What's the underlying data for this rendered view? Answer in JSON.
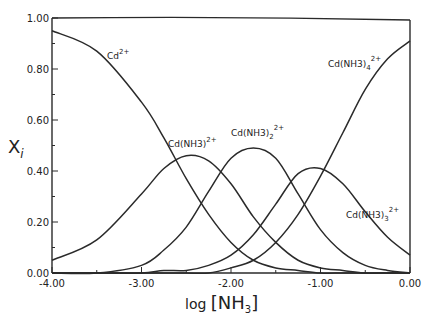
{
  "chart_data": {
    "type": "line",
    "title": "",
    "xlabel": "log [NH3]",
    "ylabel": "X_i",
    "xlim": [
      -4.0,
      0.0
    ],
    "ylim": [
      0.0,
      1.0
    ],
    "x_ticks": [
      "-4.00",
      "-3.00",
      "-2.00",
      "-1.00",
      "0.00"
    ],
    "y_ticks": [
      "0.00",
      "0.20",
      "0.40",
      "0.60",
      "0.80",
      "1.00"
    ],
    "grid": false,
    "legend": "inline labels",
    "x": [
      -4.0,
      -3.5,
      -3.0,
      -2.75,
      -2.5,
      -2.25,
      -2.0,
      -1.75,
      -1.5,
      -1.25,
      -1.0,
      -0.75,
      -0.5,
      -0.25,
      0.0
    ],
    "series": [
      {
        "name": "Cd2+",
        "label": "Cd",
        "charge": "2+",
        "values": [
          0.95,
          0.87,
          0.67,
          0.53,
          0.37,
          0.23,
          0.12,
          0.05,
          0.02,
          0.01,
          0.0,
          0.0,
          0.0,
          0.0,
          0.0
        ]
      },
      {
        "name": "Cd(NH3)2+",
        "label": "Cd(NH3)",
        "sub": "",
        "charge": "2+",
        "values": [
          0.05,
          0.13,
          0.31,
          0.41,
          0.46,
          0.44,
          0.35,
          0.22,
          0.12,
          0.05,
          0.02,
          0.01,
          0.0,
          0.0,
          0.0
        ]
      },
      {
        "name": "Cd(NH3)2 2+",
        "label": "Cd(NH3)",
        "sub": "2",
        "charge": "2+",
        "values": [
          0.0,
          0.0,
          0.03,
          0.09,
          0.18,
          0.32,
          0.45,
          0.49,
          0.45,
          0.31,
          0.17,
          0.08,
          0.03,
          0.01,
          0.0
        ]
      },
      {
        "name": "Cd(NH3)3 2+",
        "label": "Cd(NH3)",
        "sub": "3",
        "charge": "2+",
        "values": [
          0.0,
          0.0,
          0.0,
          0.01,
          0.01,
          0.03,
          0.07,
          0.15,
          0.27,
          0.39,
          0.41,
          0.35,
          0.24,
          0.14,
          0.07
        ]
      },
      {
        "name": "Cd(NH3)4 2+",
        "label": "Cd(NH3)",
        "sub": "4",
        "charge": "2+",
        "values": [
          0.0,
          0.0,
          0.0,
          0.0,
          0.0,
          0.0,
          0.02,
          0.05,
          0.12,
          0.23,
          0.38,
          0.55,
          0.72,
          0.84,
          0.91
        ]
      }
    ],
    "sum_line": {
      "name": "sum",
      "value": 1.0
    }
  },
  "labels": {
    "xlabel_text": "log",
    "xlabel_bracket": "[NH",
    "xlabel_sub": "3",
    "xlabel_close": "]",
    "ylabel_text": "X",
    "ylabel_sub": "i"
  }
}
